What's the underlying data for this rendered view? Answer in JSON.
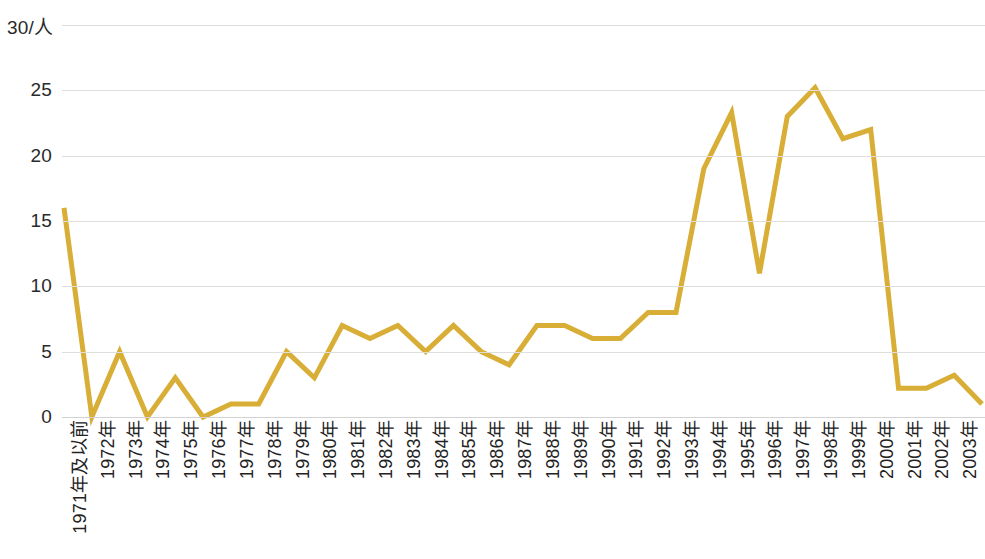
{
  "chart_data": {
    "type": "line",
    "title": "",
    "subtitle": "",
    "xlabel": "",
    "ylabel": "",
    "unit_label": "30/人",
    "ylim": [
      0,
      30
    ],
    "yticks": [
      0,
      5,
      10,
      15,
      20,
      25,
      30
    ],
    "ytick_labels": [
      "0",
      "5",
      "10",
      "15",
      "20",
      "25",
      "30"
    ],
    "grid": true,
    "grid_axis": "y",
    "legend": false,
    "legend_position": "none",
    "line_color": "#D8AE36",
    "line_width": 5,
    "grid_color": "#DEDEDD",
    "text_color": "#222222",
    "background": "#FFFFFF",
    "categories": [
      "1971年及以前",
      "1972年",
      "1973年",
      "1974年",
      "1975年",
      "1976年",
      "1977年",
      "1978年",
      "1979年",
      "1980年",
      "1981年",
      "1982年",
      "1983年",
      "1984年",
      "1985年",
      "1986年",
      "1987年",
      "1988年",
      "1989年",
      "1990年",
      "1991年",
      "1992年",
      "1993年",
      "1994年",
      "1995年",
      "1996年",
      "1997年",
      "1998年",
      "1999年",
      "2000年",
      "2001年",
      "2002年",
      "2003年",
      "2004年"
    ],
    "values": [
      16,
      0,
      5,
      0,
      3,
      0,
      1,
      1,
      5,
      3,
      7,
      6,
      7,
      5,
      7,
      5,
      4,
      7,
      7,
      6,
      6,
      8,
      8,
      19,
      23.3,
      11,
      23,
      25.2,
      21.3,
      22,
      2.2,
      2.2,
      3.2,
      1
    ],
    "series": [
      {
        "name": "",
        "values": [
          16,
          0,
          5,
          0,
          3,
          0,
          1,
          1,
          5,
          3,
          7,
          6,
          7,
          5,
          7,
          5,
          4,
          7,
          7,
          6,
          6,
          8,
          8,
          19,
          23.3,
          11,
          23,
          25.2,
          21.3,
          22,
          2.2,
          2.2,
          3.2,
          1
        ]
      }
    ]
  }
}
